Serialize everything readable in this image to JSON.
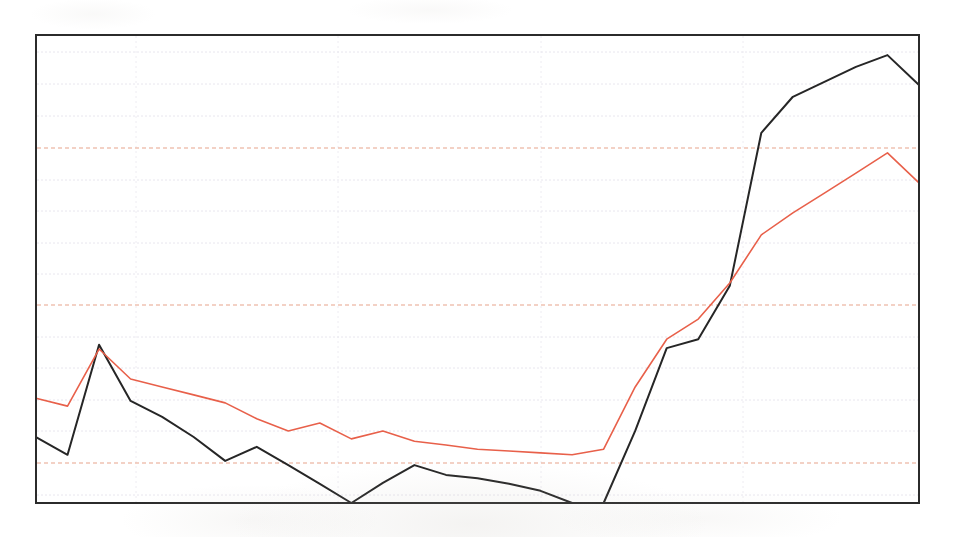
{
  "figure": {
    "kind": "scanned-line-chart",
    "background_color": "#ffffff",
    "has_title": false,
    "has_axis_labels": false,
    "has_tick_labels": false,
    "has_legend": false
  },
  "plot_frame": {
    "left": 36,
    "top": 35,
    "right": 919,
    "bottom": 503,
    "border_color": "#2b2b2b",
    "border_width": 2
  },
  "grid": {
    "minor_color": "#e8e6ee",
    "major_color": "#e8a48c",
    "minor_dash": "2,2",
    "major_dash": "4,3",
    "minor_y": [
      52,
      84,
      116,
      180,
      211,
      243,
      274,
      337,
      368,
      400,
      431,
      495
    ],
    "major_y": [
      148,
      305,
      463
    ],
    "vertical_x": [
      136,
      338,
      541,
      743
    ]
  },
  "chart_data": {
    "type": "line",
    "title": "",
    "xlabel": "",
    "ylabel": "",
    "grid": true,
    "legend": false,
    "xlim": [
      0,
      28
    ],
    "ylim": [
      0,
      100
    ],
    "x": [
      0,
      1,
      2,
      3,
      4,
      5,
      6,
      7,
      8,
      9,
      10,
      11,
      12,
      13,
      14,
      15,
      16,
      17,
      18,
      19,
      20,
      21,
      22,
      23,
      24,
      25,
      26,
      27,
      28
    ],
    "series": [
      {
        "name": "black-series",
        "color": "#262626",
        "width": 2.0,
        "values": [
          14.1,
          10.3,
          33.8,
          21.8,
          18.4,
          14.1,
          9.0,
          12.0,
          8.1,
          4.1,
          0.0,
          4.3,
          8.1,
          6.0,
          5.3,
          4.1,
          2.6,
          0.0,
          0.0,
          15.4,
          33.1,
          35.0,
          46.4,
          79.1,
          86.8,
          90.0,
          93.2,
          95.7,
          89.3
        ],
        "pixel_points": [
          [
            36,
            437
          ],
          [
            58,
            455
          ],
          [
            98,
            345
          ],
          [
            120,
            403
          ],
          [
            140,
            419
          ],
          [
            160,
            437
          ],
          [
            180,
            461
          ],
          [
            200,
            447
          ],
          [
            220,
            465
          ],
          [
            240,
            484
          ],
          [
            260,
            503
          ],
          [
            280,
            483
          ],
          [
            300,
            465
          ],
          [
            320,
            475
          ],
          [
            338,
            478
          ],
          [
            358,
            484
          ],
          [
            378,
            491
          ],
          [
            400,
            503
          ],
          [
            420,
            503
          ],
          [
            440,
            431
          ],
          [
            460,
            348
          ],
          [
            480,
            338
          ],
          [
            500,
            285
          ],
          [
            520,
            132
          ],
          [
            540,
            96
          ],
          [
            560,
            81
          ],
          [
            580,
            66
          ],
          [
            600,
            55
          ],
          [
            620,
            85
          ]
        ]
      },
      {
        "name": "red-series",
        "color": "#e8604a",
        "width": 1.6,
        "values": [
          22.4,
          20.7,
          32.9,
          26.5,
          24.8,
          23.1,
          21.4,
          18.0,
          15.4,
          17.1,
          13.7,
          15.4,
          13.2,
          12.4,
          11.5,
          11.1,
          10.7,
          10.3,
          11.5,
          24.8,
          35.0,
          39.3,
          47.0,
          57.3,
          62.0,
          66.2,
          70.5,
          74.8,
          68.4
        ]
      }
    ]
  },
  "colors": {
    "black_line": "#262626",
    "red_line": "#e8604a",
    "grid_minor": "#e8e6ee",
    "grid_major": "#e8a48c",
    "frame": "#2b2b2b",
    "paper": "#ffffff"
  }
}
